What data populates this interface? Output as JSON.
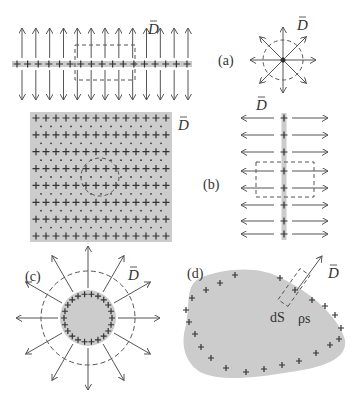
{
  "colors": {
    "background": "#ffffff",
    "charge_fill": "#cccccc",
    "stroke": "#555555",
    "dark": "#333333"
  },
  "vector_label": "D",
  "panels": {
    "a": {
      "label": "(a)",
      "line_charge": {
        "y": 64,
        "x_start": 12,
        "x_end": 192,
        "plus_count": 17,
        "arrow_count": 13,
        "arrow_len": 30
      },
      "dashed_box": {
        "x": 75,
        "y": 45,
        "w": 60,
        "h": 35
      },
      "point_charge": {
        "cx": 283,
        "cy": 60,
        "circle_r": 20,
        "arrow_len": 33,
        "arrow_count": 8
      },
      "D_label_line": {
        "x": 148,
        "y": 34
      },
      "D_label_point": {
        "x": 297,
        "y": 30
      },
      "label_pos": {
        "x": 218,
        "y": 65
      }
    },
    "b": {
      "label": "(b)",
      "plate": {
        "x": 30,
        "y": 112,
        "w": 142,
        "h": 130,
        "plus_rows": 8,
        "plus_cols": 14
      },
      "dashed_circle": {
        "cx": 100,
        "cy": 177,
        "r": 19
      },
      "D_label_plate": {
        "x": 178,
        "y": 130
      },
      "sheet": {
        "x": 284,
        "y_start": 113,
        "y_end": 240,
        "rows": [
          118,
          135,
          152,
          171,
          188,
          205,
          221,
          234
        ],
        "arrow_left": 241,
        "arrow_right": 328
      },
      "dashed_box": {
        "x": 256,
        "y": 162,
        "w": 58,
        "h": 35
      },
      "D_label_sheet": {
        "x": 256,
        "y": 110
      },
      "label_pos": {
        "x": 203,
        "y": 189
      }
    },
    "c": {
      "label": "(c)",
      "sphere": {
        "cx": 88,
        "cy": 318,
        "r": 28,
        "plus_count": 22
      },
      "dashed_circle_r": 47,
      "arrow_len": 72,
      "arrow_count": 12,
      "D_label": {
        "x": 128,
        "y": 280
      },
      "label_pos": {
        "x": 25,
        "y": 281
      }
    },
    "d": {
      "label": "(d)",
      "blob_path": "M200,278 C225,268 260,265 285,280 C315,295 340,320 345,340 C348,360 320,368 290,372 C255,378 220,382 200,372 C185,362 180,345 186,325 C190,305 185,285 200,278 Z",
      "charges": [
        [
          235,
          275
        ],
        [
          220,
          283
        ],
        [
          206,
          290
        ],
        [
          192,
          298
        ],
        [
          186,
          310
        ],
        [
          189,
          322
        ],
        [
          195,
          334
        ],
        [
          201,
          347
        ],
        [
          211,
          358
        ],
        [
          226,
          368
        ],
        [
          246,
          372
        ],
        [
          264,
          369
        ],
        [
          282,
          365
        ],
        [
          299,
          361
        ],
        [
          316,
          353
        ],
        [
          330,
          345
        ],
        [
          339,
          339
        ],
        [
          341,
          328
        ],
        [
          335,
          315
        ],
        [
          325,
          306
        ],
        [
          312,
          300
        ],
        [
          295,
          290
        ],
        [
          280,
          278
        ]
      ],
      "tube": {
        "x1": 283,
        "y1": 303,
        "x2": 305,
        "y2": 272
      },
      "arrow": {
        "x1": 297,
        "y1": 290,
        "x2": 322,
        "y2": 256
      },
      "D_label": {
        "x": 328,
        "y": 278
      },
      "dS_label": {
        "text": "dS",
        "x": 270,
        "y": 322
      },
      "rho_label": {
        "text": "ρs",
        "x": 298,
        "y": 323
      },
      "label_pos": {
        "x": 187,
        "y": 278
      }
    }
  }
}
